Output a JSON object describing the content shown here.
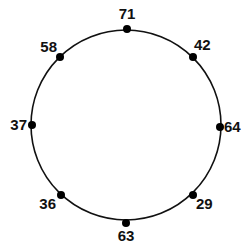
{
  "diagram": {
    "type": "number-circle",
    "circle": {
      "cx": 126,
      "cy": 125,
      "r": 95,
      "stroke": "#111111"
    },
    "points": [
      {
        "value": "71",
        "x": 127,
        "y": 29,
        "lx": 127,
        "ly": 19,
        "anchor": "middle"
      },
      {
        "value": "42",
        "x": 193,
        "y": 57,
        "lx": 194,
        "ly": 50,
        "anchor": "start"
      },
      {
        "value": "64",
        "x": 220,
        "y": 127,
        "lx": 224,
        "ly": 132,
        "anchor": "start"
      },
      {
        "value": "29",
        "x": 193,
        "y": 195,
        "lx": 196,
        "ly": 209,
        "anchor": "start"
      },
      {
        "value": "63",
        "x": 126,
        "y": 223,
        "lx": 126,
        "ly": 241,
        "anchor": "middle"
      },
      {
        "value": "36",
        "x": 61,
        "y": 195,
        "lx": 56,
        "ly": 209,
        "anchor": "end"
      },
      {
        "value": "37",
        "x": 32,
        "y": 125,
        "lx": 27,
        "ly": 130,
        "anchor": "end"
      },
      {
        "value": "58",
        "x": 60,
        "y": 57,
        "lx": 57,
        "ly": 52,
        "anchor": "end"
      }
    ]
  }
}
